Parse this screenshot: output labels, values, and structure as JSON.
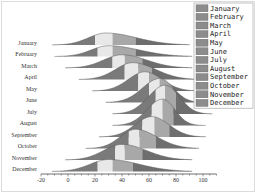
{
  "chart_data": {
    "type": "ridgeline",
    "title": "",
    "xlabel": "",
    "ylabel": "",
    "xlim": [
      -20,
      110
    ],
    "x_ticks": [
      -20,
      0,
      20,
      40,
      60,
      80,
      100
    ],
    "x_minor_ticks_step": 5,
    "grid": false,
    "legend_position": "upper right",
    "categories": [
      "January",
      "February",
      "March",
      "April",
      "May",
      "June",
      "July",
      "August",
      "September",
      "October",
      "November",
      "December"
    ],
    "series": [
      {
        "name": "January",
        "min": 0,
        "q1": 20,
        "median": 33,
        "q3": 50,
        "max": 78,
        "peak": 28,
        "height": 1.0
      },
      {
        "name": "February",
        "min": 2,
        "q1": 22,
        "median": 33,
        "q3": 50,
        "max": 80,
        "peak": 30,
        "height": 0.9
      },
      {
        "name": "March",
        "min": 10,
        "q1": 33,
        "median": 42,
        "q3": 55,
        "max": 80,
        "peak": 40,
        "height": 1.1
      },
      {
        "name": "April",
        "min": 20,
        "q1": 42,
        "median": 52,
        "q3": 62,
        "max": 85,
        "peak": 48,
        "height": 1.4
      },
      {
        "name": "May",
        "min": 30,
        "q1": 52,
        "median": 60,
        "q3": 72,
        "max": 85,
        "peak": 57,
        "height": 1.6
      },
      {
        "name": "June",
        "min": 40,
        "q1": 60,
        "median": 68,
        "q3": 78,
        "max": 90,
        "peak": 68,
        "height": 2.0
      },
      {
        "name": "July",
        "min": 45,
        "q1": 65,
        "median": 72,
        "q3": 80,
        "max": 95,
        "peak": 72,
        "height": 2.4
      },
      {
        "name": "August",
        "min": 45,
        "q1": 62,
        "median": 70,
        "q3": 78,
        "max": 90,
        "peak": 70,
        "height": 2.2
      },
      {
        "name": "September",
        "min": 35,
        "q1": 55,
        "median": 64,
        "q3": 75,
        "max": 90,
        "peak": 62,
        "height": 1.7
      },
      {
        "name": "October",
        "min": 25,
        "q1": 45,
        "median": 53,
        "q3": 65,
        "max": 85,
        "peak": 50,
        "height": 1.6
      },
      {
        "name": "November",
        "min": 10,
        "q1": 35,
        "median": 42,
        "q3": 55,
        "max": 80,
        "peak": 40,
        "height": 1.3
      },
      {
        "name": "December",
        "min": 0,
        "q1": 22,
        "median": 33,
        "q3": 48,
        "max": 80,
        "peak": 30,
        "height": 1.0
      }
    ],
    "quantile_fill_colors": [
      "#7a7a7a",
      "#e8e8e8",
      "#a8a8a8",
      "#6e6e6e"
    ],
    "legend_entries": [
      "January",
      "February",
      "March",
      "April",
      "May",
      "June",
      "July",
      "August",
      "September",
      "October",
      "November",
      "December"
    ],
    "legend_swatch_color": "#8c8c8c"
  }
}
